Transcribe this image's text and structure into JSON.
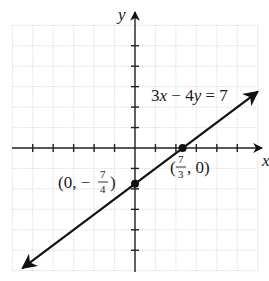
{
  "chart_data": {
    "type": "line",
    "title": "",
    "equation": "3x − 4y = 7",
    "xlabel": "x",
    "ylabel": "y",
    "xlim": [
      -6,
      6
    ],
    "ylim": [
      -6,
      6
    ],
    "grid": true,
    "tick_spacing": 1,
    "series": [
      {
        "name": "3x − 4y = 7",
        "slope": 0.75,
        "intercept": -1.75,
        "x": [
          -5.5,
          6
        ],
        "y": [
          -5.875,
          2.75
        ],
        "arrows_both_ends": true
      }
    ],
    "points": [
      {
        "label": "(0, −7/4)",
        "x": 0,
        "y": -1.75
      },
      {
        "label": "(7/3, 0)",
        "x": 2.3333,
        "y": 0
      }
    ]
  },
  "labels": {
    "x_axis": "x",
    "y_axis": "y",
    "equation": "3x − 4y = 7",
    "y_intercept": {
      "open": "(0, −",
      "num": "7",
      "den": "4",
      "close": ")"
    },
    "x_intercept": {
      "open": "(",
      "num": "7",
      "den": "3",
      "close": ", 0)"
    }
  },
  "colors": {
    "grid": "#c8c8c8",
    "axis": "#222222",
    "line": "#111111"
  }
}
